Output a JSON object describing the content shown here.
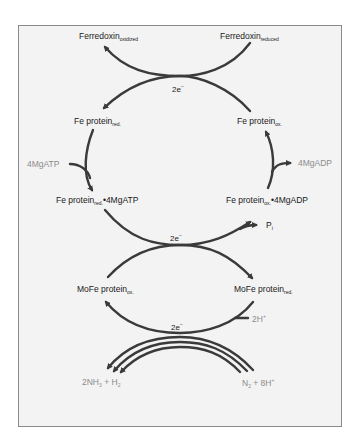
{
  "diagram": {
    "colors": {
      "arrow": "#3a3a3a",
      "text": "#1a1a1a",
      "muted_text": "#8c8c8c",
      "panel": "#f3f3f3",
      "border": "#8a8a8a"
    },
    "nodes": {
      "ferredoxin_oxidized": {
        "name": "Ferredoxin",
        "sub": "oxidized"
      },
      "ferredoxin_reduced": {
        "name": "Ferredoxin",
        "sub": "reduced"
      },
      "fe_protein_red": {
        "name": "Fe protein",
        "sub": "red."
      },
      "fe_protein_ox": {
        "name": "Fe protein",
        "sub": "ox."
      },
      "fe_protein_red_atp": {
        "name": "Fe protein",
        "sub": "red.",
        "suffix": "•4MgATP"
      },
      "fe_protein_ox_adp": {
        "name": "Fe protein",
        "sub": "ox.",
        "suffix": "•4MgADP"
      },
      "mofe_protein_ox": {
        "name": "MoFe protein",
        "sub": "ox."
      },
      "mofe_protein_red": {
        "name": "MoFe protein",
        "sub": "red."
      }
    },
    "inputs_outputs": {
      "mgatp": "4MgATP",
      "mgadp": "4MgADP",
      "pi": {
        "name": "P",
        "sub": "i"
      },
      "two_h": {
        "name": "2H",
        "sup": "+"
      },
      "products": {
        "a": "2NH",
        "a_sub": "3",
        "plus": " + H",
        "b_sub": "2"
      },
      "substrates": {
        "a": "N",
        "a_sub": "2",
        "plus": " + 8H",
        "b_sup": "+"
      }
    },
    "electron_transfers": [
      {
        "id": "top",
        "label": "2e",
        "sup": "−"
      },
      {
        "id": "middle",
        "label": "2e",
        "sup": "−"
      },
      {
        "id": "bottom",
        "label": "2e",
        "sup": "−"
      }
    ]
  }
}
